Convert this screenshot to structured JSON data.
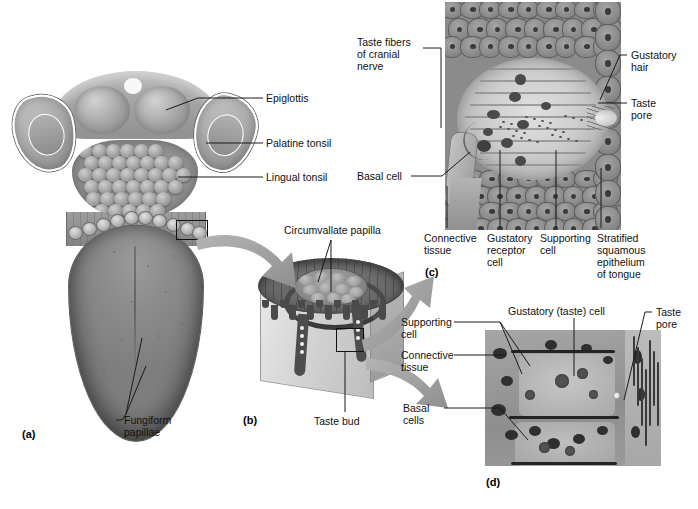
{
  "figure": {
    "panel_ids": {
      "a": "(a)",
      "b": "(b)",
      "c": "(c)",
      "d": "(d)"
    }
  },
  "panel_a": {
    "id": "(a)",
    "labels": [
      {
        "key": "epiglottis",
        "text": "Epiglottis"
      },
      {
        "key": "palatine_tonsil",
        "text": "Palatine tonsil"
      },
      {
        "key": "lingual_tonsil",
        "text": "Lingual tonsil"
      },
      {
        "key": "fungiform",
        "text": "Fungiform\npapillae"
      }
    ]
  },
  "panel_b": {
    "id": "(b)",
    "labels": [
      {
        "key": "circumvallate",
        "text": "Circumvallate papilla"
      },
      {
        "key": "taste_bud",
        "text": "Taste bud"
      }
    ]
  },
  "panel_c": {
    "id": "(c)",
    "labels": [
      {
        "key": "taste_fibers",
        "text": "Taste fibers\nof cranial\nnerve"
      },
      {
        "key": "basal_cell",
        "text": "Basal cell"
      },
      {
        "key": "gustatory_hair",
        "text": "Gustatory\nhair"
      },
      {
        "key": "taste_pore",
        "text": "Taste\npore"
      },
      {
        "key": "connective",
        "text": "Connective\ntissue"
      },
      {
        "key": "gust_receptor",
        "text": "Gustatory\nreceptor\ncell"
      },
      {
        "key": "supporting",
        "text": "Supporting\ncell"
      },
      {
        "key": "stratified",
        "text": "Stratified\nsquamous\nepithelium\nof tongue"
      }
    ]
  },
  "panel_d": {
    "id": "(d)",
    "labels": [
      {
        "key": "supporting_cell",
        "text": "Supporting\ncell"
      },
      {
        "key": "connective",
        "text": "Connective\ntissue"
      },
      {
        "key": "gustatory_cell",
        "text": "Gustatory (taste) cell"
      },
      {
        "key": "taste_pore",
        "text": "Taste\npore"
      },
      {
        "key": "basal_cells",
        "text": "Basal\ncells"
      }
    ]
  },
  "colors": {
    "background": "#ffffff",
    "text": "#111111",
    "leader_line": "#1b1b1b",
    "arrow_gray": "#9b9b9b",
    "tissue_gray": "#8b8b8b",
    "dark_gray": "#4a4a4a"
  }
}
